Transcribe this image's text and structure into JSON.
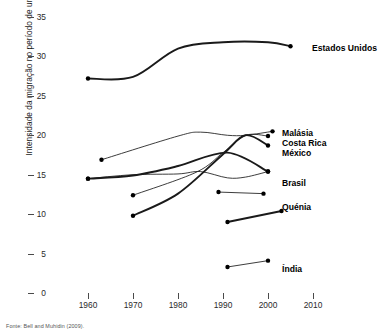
{
  "figure": {
    "source_note": "Fonte: Bell and Muhidin (2009)."
  },
  "chart_data": {
    "type": "line",
    "title": "",
    "xlabel": "",
    "ylabel": "Intensidade da migração no período de uma vida (%)",
    "xlim": [
      1960,
      2010
    ],
    "ylim": [
      0,
      35
    ],
    "xticks": [
      1960,
      1970,
      1980,
      1990,
      2000,
      2010
    ],
    "yticks": [
      0,
      5,
      10,
      15,
      20,
      25,
      30,
      35
    ],
    "grid": false,
    "legend": "inline-right-labels",
    "background": "#ffffff",
    "line_color": "#1a1a1a",
    "marker_color": "#000000",
    "series": [
      {
        "name": "Estados Unidos",
        "weight": "thick",
        "label_x": 312,
        "label_y": 44,
        "points": [
          {
            "x": 1960,
            "y": 27.2
          },
          {
            "x": 1970,
            "y": 27.4
          },
          {
            "x": 1980,
            "y": 31.0
          },
          {
            "x": 1990,
            "y": 31.8
          },
          {
            "x": 2000,
            "y": 31.8
          },
          {
            "x": 2005,
            "y": 31.3
          }
        ]
      },
      {
        "name": "Malásia",
        "weight": "thin",
        "label_x": 282,
        "label_y": 129,
        "points": [
          {
            "x": 1963,
            "y": 16.9
          },
          {
            "x": 1980,
            "y": 19.9
          },
          {
            "x": 1985,
            "y": 20.4
          },
          {
            "x": 1991,
            "y": 20.0
          },
          {
            "x": 1995,
            "y": 20.0
          },
          {
            "x": 2001,
            "y": 20.5
          }
        ]
      },
      {
        "name": "Costa Rica",
        "weight": "thin",
        "label_x": 282,
        "label_y": 139,
        "points": [
          {
            "x": 1970,
            "y": 12.4
          },
          {
            "x": 1984,
            "y": 15.3
          },
          {
            "x": 1990,
            "y": 17.8
          },
          {
            "x": 1995,
            "y": 20.0
          },
          {
            "x": 2000,
            "y": 19.9
          }
        ]
      },
      {
        "name": "México",
        "weight": "thick",
        "label_x": 282,
        "label_y": 149,
        "points": [
          {
            "x": 1970,
            "y": 9.8
          },
          {
            "x": 1980,
            "y": 12.6
          },
          {
            "x": 1990,
            "y": 17.6
          },
          {
            "x": 1995,
            "y": 20.0
          },
          {
            "x": 2000,
            "y": 18.7
          }
        ]
      },
      {
        "name": "Brasil",
        "weight": "thick",
        "label_x": 282,
        "label_y": 179,
        "points": [
          {
            "x": 1960,
            "y": 14.5
          },
          {
            "x": 1970,
            "y": 14.9
          },
          {
            "x": 1980,
            "y": 16.1
          },
          {
            "x": 1991,
            "y": 17.8
          },
          {
            "x": 2000,
            "y": 15.4
          }
        ]
      },
      {
        "name": "Quénia",
        "weight": "thin",
        "label_x": 282,
        "label_y": 203,
        "points": [
          {
            "x": 1989,
            "y": 12.8
          },
          {
            "x": 1999,
            "y": 12.6
          }
        ]
      },
      {
        "name": "Brasil-secondary",
        "weight": "thin",
        "label_x": null,
        "label_y": null,
        "points": [
          {
            "x": 1960,
            "y": 14.5
          },
          {
            "x": 1970,
            "y": 15.0
          },
          {
            "x": 1980,
            "y": 15.1
          },
          {
            "x": 1985,
            "y": 15.4
          },
          {
            "x": 1991,
            "y": 14.6
          },
          {
            "x": 1995,
            "y": 14.7
          },
          {
            "x": 2000,
            "y": 15.4
          }
        ]
      },
      {
        "name": "unlabelled-segment",
        "weight": "thick",
        "label_x": null,
        "label_y": null,
        "points": [
          {
            "x": 1991,
            "y": 9.0
          },
          {
            "x": 2003,
            "y": 10.4
          }
        ]
      },
      {
        "name": "Índia",
        "weight": "thin",
        "label_x": 282,
        "label_y": 265,
        "points": [
          {
            "x": 1991,
            "y": 3.3
          },
          {
            "x": 2000,
            "y": 4.1
          }
        ]
      }
    ]
  }
}
